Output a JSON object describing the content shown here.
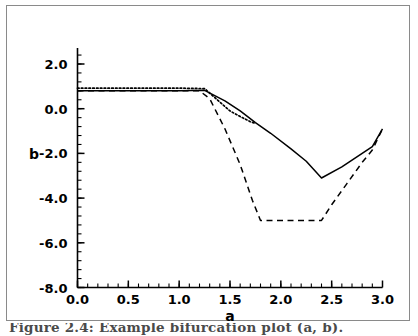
{
  "figure": {
    "caption": "Figure 2.4: Example bifurcation plot (a, b)."
  },
  "chart_data": {
    "type": "line",
    "title": "",
    "xlabel": "a",
    "ylabel": "b",
    "xlim": [
      0.0,
      3.0
    ],
    "ylim": [
      -8.0,
      2.6
    ],
    "grid": false,
    "legend": "none",
    "xticks": [
      0.0,
      0.5,
      1.0,
      1.5,
      2.0,
      2.5,
      3.0
    ],
    "xtick_labels": [
      "0.0",
      "0.5",
      "1.0",
      "1.5",
      "2.0",
      "2.5",
      "3.0"
    ],
    "yticks": [
      2.0,
      0.0,
      -2.0,
      -4.0,
      -6.0,
      -8.0
    ],
    "ytick_labels": [
      "2.0",
      "0.0",
      "-2.0",
      "-4.0",
      "-6.0",
      "-8.0"
    ],
    "minor_ticks": true,
    "series": [
      {
        "name": "solid-curve",
        "style": "solid",
        "color": "#000000",
        "x": [
          0.0,
          0.25,
          0.5,
          0.75,
          1.0,
          1.25,
          1.45,
          1.6,
          1.75,
          1.9,
          2.1,
          2.25,
          2.4,
          2.6,
          2.8,
          2.9,
          3.0
        ],
        "y": [
          0.8,
          0.8,
          0.8,
          0.8,
          0.8,
          0.82,
          0.35,
          -0.1,
          -0.62,
          -1.1,
          -1.8,
          -2.35,
          -3.1,
          -2.6,
          -2.0,
          -1.7,
          -0.9
        ]
      },
      {
        "name": "dotted-curve",
        "style": "dotted",
        "color": "#000000",
        "x": [
          0.0,
          0.25,
          0.5,
          0.75,
          1.0,
          1.25,
          1.4,
          1.5,
          1.6,
          1.7,
          1.75
        ],
        "y": [
          0.92,
          0.92,
          0.92,
          0.92,
          0.92,
          0.9,
          0.3,
          -0.1,
          -0.35,
          -0.58,
          -0.66
        ]
      },
      {
        "name": "dashed-curve",
        "style": "dashed",
        "color": "#000000",
        "x": [
          0.0,
          0.25,
          0.5,
          0.75,
          1.0,
          1.2,
          1.3,
          1.45,
          1.6,
          1.72,
          1.8,
          2.0,
          2.2,
          2.4,
          2.5,
          2.65,
          2.8,
          2.9,
          3.0
        ],
        "y": [
          0.8,
          0.8,
          0.8,
          0.8,
          0.8,
          0.8,
          0.45,
          -0.9,
          -2.5,
          -4.1,
          -5.0,
          -5.0,
          -5.0,
          -5.0,
          -4.3,
          -3.35,
          -2.4,
          -1.85,
          -0.9
        ]
      }
    ]
  }
}
